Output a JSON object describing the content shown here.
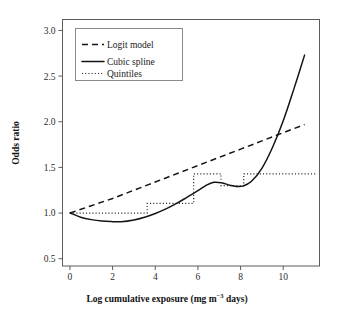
{
  "chart_data": {
    "type": "line",
    "title": "",
    "xlabel": "Log cumulative exposure (mg m−3 days)",
    "xlabel_parts": {
      "main": "Log cumulative exposure (mg m",
      "sup": "−3",
      "tail": " days)"
    },
    "ylabel": "Odds ratio",
    "xlim": [
      -0.35,
      11.7
    ],
    "ylim": [
      0.42,
      3.12
    ],
    "xticks": [
      0,
      2,
      4,
      6,
      8,
      10
    ],
    "xtick_labels": [
      "0",
      "2",
      "4",
      "6",
      "8",
      "10"
    ],
    "yticks": [
      0.5,
      1.0,
      1.5,
      2.0,
      2.5,
      3.0
    ],
    "ytick_labels": [
      "0.5",
      "1.0",
      "1.5",
      "2.0",
      "2.5",
      "3.0"
    ],
    "grid": false,
    "legend_position": "top-left",
    "legend_entries": [
      {
        "label": "Logit model",
        "style": "dashed"
      },
      {
        "label": "Cubic spline",
        "style": "solid"
      },
      {
        "label": "Quintiles",
        "style": "dotted"
      }
    ],
    "series": [
      {
        "name": "Logit model",
        "style": "dashed",
        "x": [
          0.0,
          1.0,
          2.0,
          3.0,
          4.0,
          5.0,
          6.0,
          7.0,
          8.0,
          9.0,
          10.0,
          11.0
        ],
        "y": [
          1.0,
          1.08,
          1.16,
          1.25,
          1.34,
          1.43,
          1.52,
          1.61,
          1.7,
          1.79,
          1.88,
          1.97
        ]
      },
      {
        "name": "Cubic spline",
        "style": "solid",
        "x": [
          0.0,
          0.5,
          1.0,
          1.5,
          2.0,
          2.4,
          3.0,
          3.5,
          4.0,
          4.5,
          5.0,
          5.5,
          6.0,
          6.4,
          6.75,
          7.1,
          7.5,
          7.8,
          8.1,
          8.5,
          9.0,
          9.5,
          10.0,
          10.5,
          11.0
        ],
        "y": [
          1.0,
          0.955,
          0.928,
          0.912,
          0.906,
          0.905,
          0.925,
          0.955,
          0.995,
          1.045,
          1.105,
          1.175,
          1.245,
          1.305,
          1.337,
          1.332,
          1.305,
          1.292,
          1.295,
          1.345,
          1.49,
          1.72,
          2.01,
          2.36,
          2.73
        ]
      },
      {
        "name": "Quintiles",
        "style": "dotted",
        "step_edges": [
          0.0,
          3.62,
          5.8,
          7.08,
          8.15,
          11.6
        ],
        "step_values": [
          1.0,
          1.105,
          1.43,
          1.3,
          1.43
        ]
      }
    ]
  }
}
